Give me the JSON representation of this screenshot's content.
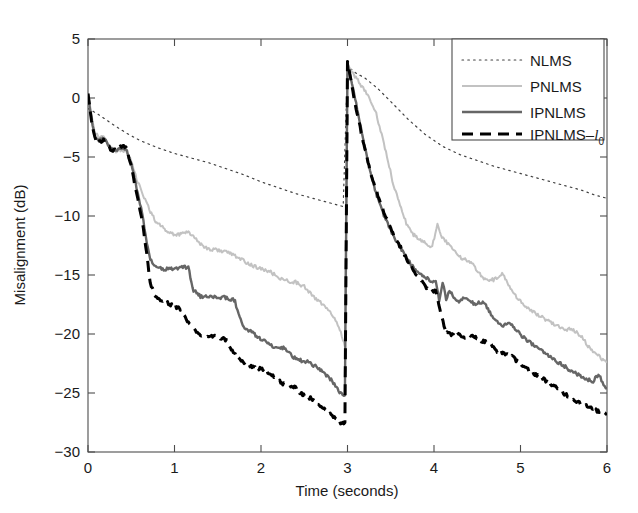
{
  "chart_data": {
    "type": "line",
    "title": "",
    "xlabel": "Time (seconds)",
    "ylabel": "Misalignment (dB)",
    "xlim": [
      0,
      6
    ],
    "ylim": [
      -30,
      5
    ],
    "xticks": [
      "0",
      "1",
      "2",
      "3",
      "4",
      "5",
      "6"
    ],
    "yticks": [
      "5",
      "0",
      "-5",
      "-10",
      "-15",
      "-20",
      "-25",
      "-30"
    ],
    "grid": false,
    "legend_position": "upper-right",
    "annotations": [
      "echo path change at t = 3 s"
    ],
    "series": [
      {
        "name": "NLMS",
        "style": "dotted",
        "color": "#404040",
        "linewidth": 1.2,
        "x": [
          0.0,
          0.05,
          0.1,
          0.2,
          0.3,
          0.45,
          0.6,
          0.8,
          1.0,
          1.2,
          1.4,
          1.6,
          1.8,
          2.0,
          2.2,
          2.4,
          2.6,
          2.8,
          2.95,
          3.0,
          3.05,
          3.1,
          3.2,
          3.35,
          3.5,
          3.7,
          3.9,
          4.1,
          4.3,
          4.5,
          4.7,
          4.9,
          5.1,
          5.3,
          5.5,
          5.7,
          5.85,
          6.0
        ],
        "y": [
          -0.9,
          -1.1,
          -1.3,
          -1.8,
          -2.3,
          -3.0,
          -3.6,
          -4.2,
          -4.7,
          -5.1,
          -5.5,
          -6.0,
          -6.5,
          -7.1,
          -7.6,
          -8.1,
          -8.5,
          -8.9,
          -9.2,
          2.6,
          2.4,
          2.1,
          1.7,
          0.8,
          -0.3,
          -1.8,
          -3.1,
          -4.1,
          -4.8,
          -5.3,
          -5.8,
          -6.2,
          -6.6,
          -7.0,
          -7.4,
          -7.8,
          -8.2,
          -8.5
        ]
      },
      {
        "name": "PNLMS",
        "style": "solid",
        "color": "#c2c2c2",
        "linewidth": 2.0,
        "x": [
          0.0,
          0.04,
          0.08,
          0.13,
          0.18,
          0.22,
          0.26,
          0.3,
          0.35,
          0.4,
          0.45,
          0.5,
          0.55,
          0.6,
          0.66,
          0.72,
          0.78,
          0.85,
          0.92,
          1.0,
          1.08,
          1.16,
          1.24,
          1.32,
          1.4,
          1.5,
          1.6,
          1.7,
          1.8,
          1.9,
          2.0,
          2.1,
          2.2,
          2.3,
          2.4,
          2.5,
          2.6,
          2.7,
          2.8,
          2.9,
          2.97,
          3.0,
          3.05,
          3.12,
          3.22,
          3.32,
          3.42,
          3.52,
          3.62,
          3.68,
          3.74,
          3.82,
          3.9,
          3.98,
          4.04,
          4.08,
          4.14,
          4.2,
          4.28,
          4.36,
          4.44,
          4.52,
          4.6,
          4.7,
          4.8,
          4.86,
          4.92,
          5.0,
          5.1,
          5.2,
          5.3,
          5.4,
          5.5,
          5.6,
          5.7,
          5.78,
          5.86,
          5.94,
          6.0
        ],
        "y": [
          0.5,
          -1.4,
          -2.9,
          -3.4,
          -3.3,
          -3.6,
          -4.2,
          -4.5,
          -4.5,
          -4.4,
          -4.6,
          -5.4,
          -6.6,
          -7.6,
          -8.6,
          -9.6,
          -10.4,
          -10.9,
          -11.3,
          -11.6,
          -11.5,
          -11.3,
          -11.9,
          -12.5,
          -12.8,
          -12.9,
          -13.0,
          -13.4,
          -13.8,
          -14.2,
          -14.5,
          -14.7,
          -15.2,
          -15.5,
          -15.6,
          -16.0,
          -16.8,
          -17.4,
          -18.2,
          -19.3,
          -21.0,
          2.9,
          2.2,
          1.5,
          0.4,
          -1.0,
          -3.8,
          -7.0,
          -9.4,
          -10.6,
          -11.4,
          -12.0,
          -12.3,
          -12.6,
          -10.6,
          -11.6,
          -12.2,
          -12.7,
          -13.4,
          -13.7,
          -14.0,
          -14.8,
          -15.4,
          -15.4,
          -14.9,
          -15.9,
          -16.6,
          -17.2,
          -17.9,
          -18.4,
          -18.8,
          -19.2,
          -19.6,
          -19.6,
          -20.2,
          -21.0,
          -21.6,
          -22.1,
          -22.4
        ]
      },
      {
        "name": "IPNLMS",
        "style": "solid",
        "color": "#666666",
        "linewidth": 2.4,
        "x": [
          0.0,
          0.04,
          0.08,
          0.13,
          0.18,
          0.22,
          0.26,
          0.3,
          0.35,
          0.4,
          0.45,
          0.5,
          0.55,
          0.6,
          0.64,
          0.68,
          0.72,
          0.78,
          0.85,
          0.95,
          1.05,
          1.12,
          1.16,
          1.22,
          1.3,
          1.4,
          1.5,
          1.58,
          1.64,
          1.7,
          1.74,
          1.8,
          1.88,
          1.96,
          2.04,
          2.12,
          2.2,
          2.26,
          2.32,
          2.4,
          2.48,
          2.56,
          2.64,
          2.72,
          2.8,
          2.86,
          2.92,
          2.97,
          3.0,
          3.04,
          3.1,
          3.18,
          3.26,
          3.34,
          3.42,
          3.5,
          3.58,
          3.66,
          3.74,
          3.82,
          3.9,
          3.96,
          4.02,
          4.06,
          4.1,
          4.14,
          4.18,
          4.24,
          4.3,
          4.36,
          4.42,
          4.48,
          4.54,
          4.6,
          4.66,
          4.72,
          4.8,
          4.88,
          4.96,
          5.04,
          5.12,
          5.2,
          5.28,
          5.36,
          5.44,
          5.52,
          5.6,
          5.68,
          5.76,
          5.84,
          5.9,
          5.96,
          6.0
        ],
        "y": [
          0.4,
          -1.8,
          -3.2,
          -3.6,
          -3.5,
          -3.8,
          -4.3,
          -4.5,
          -4.4,
          -4.3,
          -4.5,
          -5.6,
          -7.2,
          -8.9,
          -10.4,
          -12.2,
          -13.6,
          -14.3,
          -14.5,
          -14.5,
          -14.4,
          -14.3,
          -14.4,
          -16.3,
          -16.8,
          -16.9,
          -16.9,
          -16.9,
          -17.0,
          -17.2,
          -18.4,
          -19.4,
          -19.8,
          -20.2,
          -20.6,
          -21.0,
          -21.3,
          -21.2,
          -21.6,
          -22.1,
          -22.3,
          -22.4,
          -22.8,
          -23.2,
          -23.8,
          -24.4,
          -25.0,
          -25.2,
          3.0,
          1.6,
          -0.5,
          -3.4,
          -6.2,
          -8.3,
          -9.9,
          -11.2,
          -12.3,
          -13.2,
          -14.2,
          -14.8,
          -15.2,
          -15.5,
          -15.5,
          -17.2,
          -15.6,
          -17.0,
          -16.3,
          -17.1,
          -17.3,
          -16.9,
          -17.2,
          -17.5,
          -17.3,
          -17.5,
          -18.4,
          -18.9,
          -19.3,
          -19.0,
          -19.8,
          -20.3,
          -20.8,
          -21.2,
          -21.6,
          -22.0,
          -22.4,
          -22.8,
          -23.2,
          -23.5,
          -23.8,
          -24.0,
          -23.4,
          -24.3,
          -24.6
        ]
      },
      {
        "name": "IPNLMS-l0",
        "style": "dashed",
        "color": "#000000",
        "linewidth": 3.0,
        "x": [
          0.0,
          0.04,
          0.08,
          0.13,
          0.18,
          0.22,
          0.26,
          0.3,
          0.35,
          0.4,
          0.45,
          0.5,
          0.55,
          0.6,
          0.64,
          0.68,
          0.72,
          0.78,
          0.85,
          0.92,
          1.0,
          1.08,
          1.16,
          1.24,
          1.3,
          1.36,
          1.44,
          1.52,
          1.6,
          1.68,
          1.76,
          1.84,
          1.92,
          2.0,
          2.08,
          2.16,
          2.24,
          2.32,
          2.4,
          2.48,
          2.56,
          2.64,
          2.72,
          2.8,
          2.86,
          2.92,
          2.97,
          3.0,
          3.04,
          3.1,
          3.18,
          3.26,
          3.34,
          3.42,
          3.5,
          3.58,
          3.66,
          3.74,
          3.82,
          3.9,
          3.96,
          4.02,
          4.08,
          4.14,
          4.2,
          4.26,
          4.32,
          4.4,
          4.48,
          4.56,
          4.64,
          4.72,
          4.8,
          4.88,
          4.96,
          5.04,
          5.12,
          5.2,
          5.28,
          5.36,
          5.44,
          5.52,
          5.6,
          5.68,
          5.76,
          5.84,
          5.92,
          6.0
        ],
        "y": [
          0.3,
          -2.0,
          -3.4,
          -3.7,
          -3.6,
          -3.9,
          -4.3,
          -4.4,
          -4.2,
          -4.0,
          -4.3,
          -5.8,
          -7.6,
          -9.4,
          -11.0,
          -13.2,
          -15.8,
          -16.8,
          -17.2,
          -17.4,
          -17.6,
          -18.0,
          -19.0,
          -19.8,
          -20.1,
          -20.2,
          -20.2,
          -20.3,
          -20.5,
          -21.6,
          -22.2,
          -22.6,
          -22.8,
          -23.0,
          -23.2,
          -23.6,
          -24.2,
          -24.3,
          -24.6,
          -25.1,
          -25.4,
          -25.8,
          -26.2,
          -26.8,
          -27.2,
          -27.6,
          -27.5,
          3.1,
          1.5,
          -0.9,
          -3.6,
          -6.1,
          -8.0,
          -9.6,
          -11.0,
          -12.2,
          -13.3,
          -14.3,
          -15.2,
          -16.0,
          -16.4,
          -16.3,
          -18.2,
          -19.9,
          -20.0,
          -19.9,
          -20.3,
          -20.2,
          -20.2,
          -20.6,
          -20.8,
          -21.4,
          -21.6,
          -21.8,
          -22.3,
          -22.8,
          -23.2,
          -23.5,
          -23.9,
          -24.3,
          -24.7,
          -25.1,
          -25.5,
          -25.8,
          -26.1,
          -26.4,
          -26.6,
          -26.7
        ]
      }
    ]
  },
  "legend": {
    "entries": [
      {
        "label": "NLMS",
        "sub": "",
        "ital": ""
      },
      {
        "label": "PNLMS",
        "sub": "",
        "ital": ""
      },
      {
        "label": "IPNLMS",
        "sub": "",
        "ital": ""
      },
      {
        "label": "IPNLMS–",
        "ital": "l",
        "sub": "0"
      }
    ]
  },
  "colors": {
    "axis": "#4d4d4d",
    "text": "#1a1a1a",
    "nlms": "#404040",
    "pnlms": "#c2c2c2",
    "ipnlms": "#666666",
    "ipnlms_l0": "#000000",
    "background": "#ffffff"
  }
}
